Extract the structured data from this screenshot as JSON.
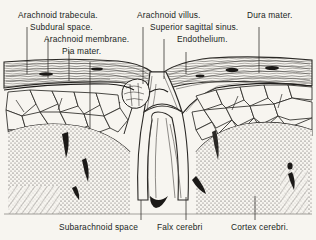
{
  "figure": {
    "kind": "anatomical-illustration",
    "background_color": "#f7f5f0",
    "ink_color": "#211f1d"
  },
  "labels_top": [
    {
      "id": "arachnoid-trabecula",
      "text": "Arachnoid trabecula.",
      "x": 18,
      "y": 16,
      "leader_x": 27,
      "leader_y1": 27,
      "leader_y2": 74
    },
    {
      "id": "subdural-space",
      "text": "Subdural space.",
      "x": 30,
      "y": 28,
      "leader_x": 48,
      "leader_y1": 39,
      "leader_y2": 78
    },
    {
      "id": "arachnoid-membrane",
      "text": "Arachnoid membrane.",
      "x": 44,
      "y": 40,
      "leader_x": 69,
      "leader_y1": 51,
      "leader_y2": 81
    },
    {
      "id": "pia-mater",
      "text": "Pia mater.",
      "x": 62,
      "y": 52,
      "leader_x": 90,
      "leader_y1": 62,
      "leader_y2": 128
    },
    {
      "id": "arachnoid-villus",
      "text": "Arachnoid villus.",
      "x": 138,
      "y": 16,
      "leader_x": 143,
      "leader_y1": 27,
      "leader_y2": 84
    },
    {
      "id": "superior-sagittal-sinus",
      "text": "Superior sagittal sinus.",
      "x": 151,
      "y": 28,
      "leader_x": 164,
      "leader_y1": 39,
      "leader_y2": 79
    },
    {
      "id": "endothelium",
      "text": "Endothelium.",
      "x": 178,
      "y": 41,
      "leader_x": 186,
      "leader_y1": 52,
      "leader_y2": 74
    },
    {
      "id": "dura-mater",
      "text": "Dura mater.",
      "x": 248,
      "y": 16,
      "leader_x": 259,
      "leader_y1": 27,
      "leader_y2": 73
    }
  ],
  "labels_bottom": [
    {
      "id": "subarachnoid-space",
      "text": "Subarachnoid space",
      "x": 60,
      "y": 224,
      "leader_x": 141,
      "leader_y1": 200,
      "leader_y2": 220
    },
    {
      "id": "falx-cerebri",
      "text": "Falx cerebri",
      "x": 158,
      "y": 224,
      "leader_x": 186,
      "leader_y1": 197,
      "leader_y2": 220
    },
    {
      "id": "cortex-cerebri",
      "text": "Cortex cerebri.",
      "x": 232,
      "y": 224,
      "leader_x": 255,
      "leader_y1": 196,
      "leader_y2": 220
    }
  ]
}
